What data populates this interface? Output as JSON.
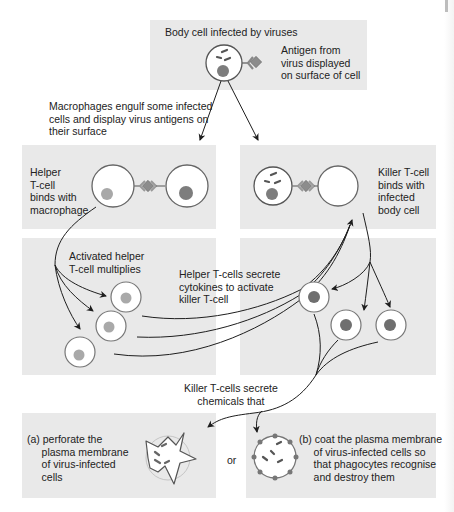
{
  "diagram": {
    "title": "Body cell infected by viruses",
    "labels": {
      "antigen": "Antigen from\nvirus displayed\non surface of cell",
      "macrophages": "Macrophages engulf some infected\ncells and display virus antigens on\ntheir surface",
      "helper_binds": "Helper\nT-cell\nbinds with\nmacrophage",
      "killer_binds": "Killer T-cell\nbinds with\ninfected\nbody cell",
      "helper_multiplies": "Activated helper\nT-cell multiplies",
      "cytokines": "Helper T-cells secrete\ncytokines to activate\nkiller T-cell",
      "killer_secrete": "Killer T-cells secrete\nchemicals that",
      "outcome_a": "(a) perforate the\n     plasma membrane\n     of virus-infected\n     cells",
      "or": "or",
      "outcome_b": "(b) coat the plasma membrane\n     of virus-infected cells so\n     that phagocytes recognise\n     and destroy them"
    },
    "icons": {
      "infected_cell": "infected-body-cell-icon",
      "antigen": "antigen-diamond-icon",
      "helper_t_cell": "helper-t-cell-icon",
      "macrophage": "macrophage-icon",
      "killer_t_cell": "killer-t-cell-icon",
      "perforated_cell": "perforated-cell-icon",
      "coated_cell": "coated-cell-icon"
    },
    "colors": {
      "panel": "#e9e9e9",
      "line": "#1e1e1e",
      "nucleus_dark": "#8a8a8a",
      "nucleus_light": "#a9a9a9",
      "nucleus_killer": "#6f6f6f",
      "antigen": "#8c8c8c",
      "cell_fill": "#ffffff"
    }
  }
}
